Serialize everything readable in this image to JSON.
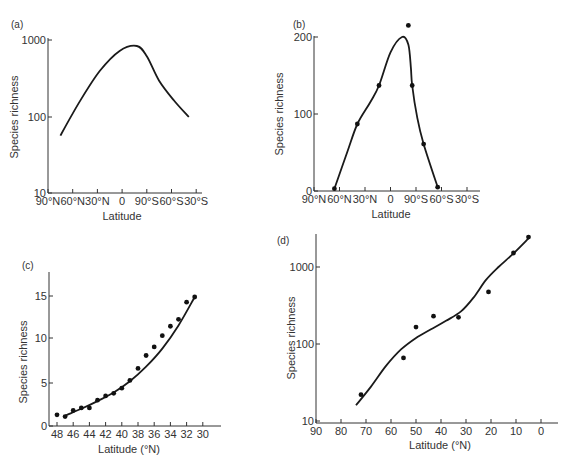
{
  "figure": {
    "panels": [
      {
        "id": "a",
        "label": "(a)",
        "xlabel": "Latitude",
        "ylabel": "Species richness"
      },
      {
        "id": "b",
        "label": "(b)",
        "xlabel": "Latitude",
        "ylabel": "Species richness"
      },
      {
        "id": "c",
        "label": "(c)",
        "xlabel": "Latitude (°N)",
        "ylabel": "Species richness"
      },
      {
        "id": "d",
        "label": "(d)",
        "xlabel": "Latitude (°N)",
        "ylabel": "Species richness"
      }
    ]
  },
  "chart_data": [
    {
      "panel": "(a)",
      "type": "line",
      "xlabel": "Latitude",
      "ylabel": "Species richness",
      "yscale": "log",
      "ylim": [
        10,
        1000
      ],
      "yticks": [
        "10",
        "100",
        "1000"
      ],
      "xticks": [
        "90°N",
        "60°N",
        "30°N",
        "0",
        "90°S",
        "60°S",
        "30°S"
      ],
      "grid": false,
      "series": [
        {
          "name": "trend",
          "x_tick_pos": [
            0.5,
            1.3,
            2.1,
            2.9,
            3.6,
            4.0,
            4.5,
            5.1,
            5.7
          ],
          "values": [
            57,
            163,
            405,
            740,
            860,
            630,
            300,
            165,
            100
          ]
        }
      ]
    },
    {
      "panel": "(b)",
      "type": "line",
      "xlabel": "Latitude",
      "ylabel": "Species richness",
      "yscale": "linear",
      "ylim": [
        0,
        200
      ],
      "yticks": [
        "0",
        "100",
        "200"
      ],
      "xticks": [
        "90°N",
        "60°N",
        "30°N",
        "0",
        "90°S",
        "60°S",
        "30°S"
      ],
      "grid": false,
      "points": {
        "x_tick_pos": [
          0.8,
          1.7,
          2.55,
          3.7,
          3.85,
          4.3,
          4.85
        ],
        "values": [
          3,
          87,
          137,
          215,
          137,
          61,
          5
        ]
      },
      "series": [
        {
          "name": "trend",
          "x_tick_pos": [
            0.8,
            1.3,
            1.7,
            2.2,
            2.55,
            3.0,
            3.45,
            3.7,
            3.8,
            3.85,
            4.05,
            4.3,
            4.85
          ],
          "values": [
            3,
            50,
            87,
            115,
            137,
            180,
            200,
            190,
            160,
            137,
            95,
            61,
            5
          ]
        }
      ]
    },
    {
      "panel": "(c)",
      "type": "scatter",
      "xlabel": "Latitude (°N)",
      "ylabel": "Species richness",
      "yscale": "linear",
      "ylim": [
        0,
        17
      ],
      "yticks": [
        "0",
        "5",
        "10",
        "15"
      ],
      "xticks": [
        "48",
        "46",
        "44",
        "42",
        "40",
        "38",
        "36",
        "34",
        "32",
        "30"
      ],
      "grid": false,
      "points": {
        "x": [
          48,
          47,
          46,
          45,
          44,
          43,
          42,
          41,
          40,
          39,
          38,
          37,
          36,
          35,
          34,
          33,
          32,
          31
        ],
        "values": [
          1.3,
          1.1,
          1.8,
          2.1,
          2.1,
          3.0,
          3.5,
          3.8,
          4.4,
          5.3,
          6.7,
          8.2,
          9.2,
          10.5,
          11.6,
          12.4,
          14.4,
          15.0
        ]
      },
      "series": [
        {
          "name": "fitted curve",
          "x": [
            47,
            45,
            43,
            41,
            39,
            37,
            35,
            33,
            31
          ],
          "values": [
            1.2,
            2.0,
            2.9,
            3.9,
            5.2,
            6.9,
            9.0,
            11.7,
            15.0
          ]
        }
      ]
    },
    {
      "panel": "(d)",
      "type": "scatter",
      "xlabel": "Latitude (°N)",
      "ylabel": "Species richness",
      "yscale": "log",
      "ylim": [
        10,
        2500
      ],
      "yticks": [
        "10",
        "100",
        "1000"
      ],
      "xticks": [
        "90",
        "80",
        "70",
        "60",
        "50",
        "40",
        "30",
        "20",
        "10",
        "0"
      ],
      "grid": false,
      "points": {
        "x": [
          72,
          55,
          50,
          43,
          33,
          21,
          11,
          5
        ],
        "values": [
          22,
          66,
          166,
          230,
          222,
          475,
          1520,
          2450
        ]
      },
      "series": [
        {
          "name": "fitted curve",
          "x": [
            74,
            68,
            62,
            56,
            50,
            44,
            38,
            32,
            27,
            22,
            17,
            11,
            5
          ],
          "values": [
            16,
            28,
            52,
            85,
            120,
            155,
            200,
            265,
            400,
            680,
            1000,
            1500,
            2350
          ]
        }
      ]
    }
  ]
}
